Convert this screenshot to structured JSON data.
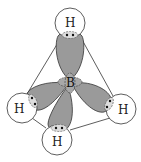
{
  "diagram": {
    "molecule": "BH4-",
    "geometry": "tetrahedral",
    "central_atom": {
      "label": "B"
    },
    "ligands": [
      {
        "id": "top",
        "label": "H"
      },
      {
        "id": "left",
        "label": "H"
      },
      {
        "id": "right",
        "label": "H"
      },
      {
        "id": "bottom",
        "label": "H"
      }
    ],
    "colors": {
      "lobe_fill": "#9a9a9a",
      "line": "#333333",
      "circle_fill": "#ffffff",
      "electron": "#111111"
    }
  }
}
